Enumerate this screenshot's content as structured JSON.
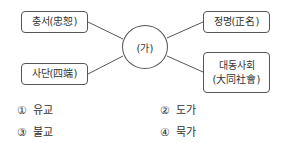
{
  "diagram": {
    "center": {
      "label": "(가)"
    },
    "nodes": [
      {
        "id": "chungseo",
        "label": "충서(忠恕)"
      },
      {
        "id": "sadan",
        "label": "사단(四端)"
      },
      {
        "id": "jeongmyeong",
        "label": "정명(正名)"
      },
      {
        "id": "daedong",
        "label_line1": "대동사회",
        "label_line2": "(大同社會)"
      }
    ]
  },
  "choices": [
    {
      "num": "①",
      "text": "유교"
    },
    {
      "num": "②",
      "text": "도가"
    },
    {
      "num": "③",
      "text": "불교"
    },
    {
      "num": "④",
      "text": "묵가"
    }
  ],
  "colors": {
    "stroke": "#555555",
    "text": "#333333",
    "background": "#ffffff"
  }
}
